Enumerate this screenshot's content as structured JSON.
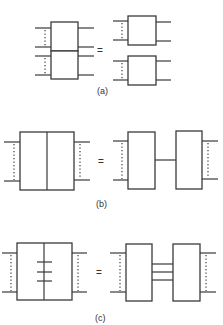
{
  "figure": {
    "panels": [
      {
        "id": "a",
        "label": "(a)",
        "equals": "=",
        "description": "Two stacked two-port blocks equal two separate two-port blocks"
      },
      {
        "id": "b",
        "label": "(b)",
        "equals": "=",
        "description": "Block split by single vertical line equals two blocks joined by one connection"
      },
      {
        "id": "c",
        "label": "(c)",
        "equals": "=",
        "description": "Block split by vertical line with three cross ticks equals two blocks joined by three connections"
      }
    ]
  },
  "colors": {
    "stroke": "#3a3a3a",
    "background": "#ffffff"
  }
}
